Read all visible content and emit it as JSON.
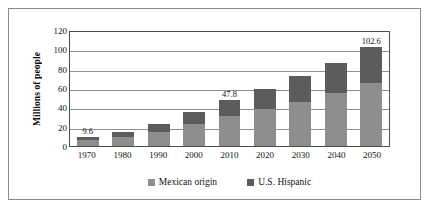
{
  "chart_data": {
    "type": "bar",
    "stacked": true,
    "title": "",
    "xlabel": "",
    "ylabel": "Millions of people",
    "ylim": [
      0,
      120
    ],
    "ytick_values": [
      0,
      20,
      40,
      60,
      80,
      100,
      120
    ],
    "ytick_labels": [
      "0",
      "20",
      "40",
      "60",
      "80",
      "100",
      "120"
    ],
    "grid": true,
    "grid_axis": "y",
    "legend_position": "bottom-center",
    "categories": [
      "1970",
      "1980",
      "1990",
      "2000",
      "2010",
      "2020",
      "2030",
      "2040",
      "2050"
    ],
    "series": [
      {
        "name": "Mexican origin",
        "color": "#8e8e8e",
        "values": [
          6.1,
          9.1,
          14.1,
          22.4,
          30.6,
          38.0,
          45.8,
          54.8,
          65.7
        ]
      },
      {
        "name": "U.S. Hispanic",
        "color": "#5c5c5c",
        "values": [
          3.5,
          5.5,
          8.3,
          12.4,
          17.2,
          21.5,
          26.2,
          31.1,
          36.9
        ]
      }
    ],
    "totals": [
      9.6,
      14.6,
      22.4,
      34.8,
      47.8,
      59.5,
      72.0,
      85.9,
      102.6
    ],
    "annotations": [
      {
        "category": "1970",
        "text": "9.6",
        "placement": "above-bar"
      },
      {
        "category": "1970",
        "text": "6.1",
        "placement": "inside-lower-segment"
      },
      {
        "category": "2010",
        "text": "47.8",
        "placement": "above-bar"
      },
      {
        "category": "2010",
        "text": "30.6",
        "placement": "inside-lower-segment"
      },
      {
        "category": "2050",
        "text": "102.6",
        "placement": "above-bar"
      },
      {
        "category": "2050",
        "text": "65.7",
        "placement": "inside-lower-segment"
      }
    ]
  },
  "bars": [
    {
      "year": "1970",
      "total": 9.6,
      "mexican": 6.1,
      "hispanic_only": 3.5,
      "total_label": "9.6",
      "inner_label": "6.1"
    },
    {
      "year": "1980",
      "total": 14.6,
      "mexican": 9.1,
      "hispanic_only": 5.5,
      "total_label": "",
      "inner_label": ""
    },
    {
      "year": "1990",
      "total": 22.4,
      "mexican": 14.1,
      "hispanic_only": 8.3,
      "total_label": "",
      "inner_label": ""
    },
    {
      "year": "2000",
      "total": 34.8,
      "mexican": 22.4,
      "hispanic_only": 12.4,
      "total_label": "",
      "inner_label": ""
    },
    {
      "year": "2010",
      "total": 47.8,
      "mexican": 30.6,
      "hispanic_only": 17.2,
      "total_label": "47.8",
      "inner_label": "30.6"
    },
    {
      "year": "2020",
      "total": 59.5,
      "mexican": 38.0,
      "hispanic_only": 21.5,
      "total_label": "",
      "inner_label": ""
    },
    {
      "year": "2030",
      "total": 72.0,
      "mexican": 45.8,
      "hispanic_only": 26.2,
      "total_label": "",
      "inner_label": ""
    },
    {
      "year": "2040",
      "total": 85.9,
      "mexican": 54.8,
      "hispanic_only": 31.1,
      "total_label": "",
      "inner_label": ""
    },
    {
      "year": "2050",
      "total": 102.6,
      "mexican": 65.7,
      "hispanic_only": 36.9,
      "total_label": "102.6",
      "inner_label": "65.7"
    }
  ],
  "legend": {
    "entries": [
      {
        "label": "Mexican origin",
        "color": "#8e8e8e"
      },
      {
        "label": "U.S. Hispanic",
        "color": "#5c5c5c"
      }
    ]
  },
  "colors": {
    "mexican_origin": "#8e8e8e",
    "us_hispanic": "#5c5c5c",
    "gridline": "#8f8f8f",
    "axis": "#4d4d4d",
    "frame": "#8a8a8a",
    "text": "#111111",
    "background": "#ffffff"
  }
}
